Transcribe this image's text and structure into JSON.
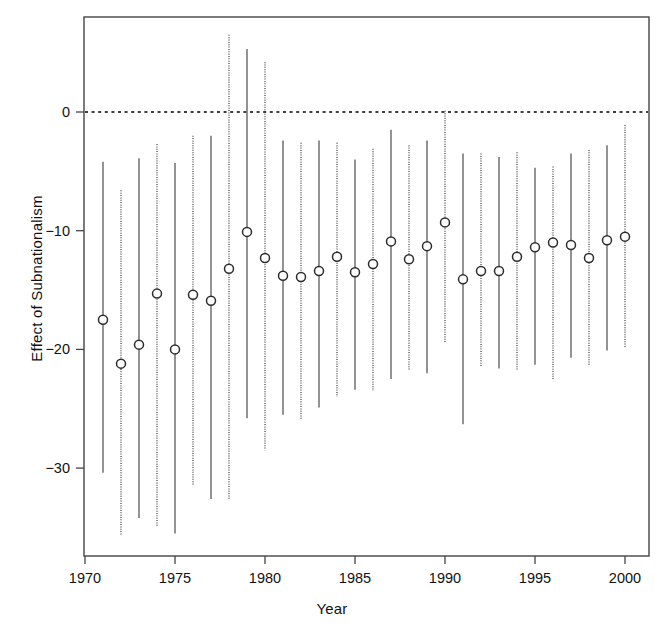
{
  "chart_data": {
    "type": "scatter",
    "title": "",
    "xlabel": "Year",
    "ylabel": "Effect of Subnationalism",
    "xlim": [
      1970.0,
      2000.9
    ],
    "ylim": [
      -37.5,
      8.5
    ],
    "xticks": [
      1970,
      1975,
      1980,
      1985,
      1990,
      1995,
      2000
    ],
    "xtick_labels": [
      "1970",
      "1975",
      "1980",
      "1985",
      "1990",
      "1995",
      "2000"
    ],
    "yticks": [
      0,
      -10,
      -20,
      -30
    ],
    "ytick_labels": [
      "0",
      "-10",
      "-20",
      "-30"
    ],
    "grid": false,
    "legend": null,
    "reference_line": {
      "y": 0,
      "style": "dotted",
      "color": "#000000"
    },
    "marker": {
      "shape": "circle-open",
      "size_px": 9,
      "color": "#2b2b2b"
    },
    "errorbar_styles": [
      "solid",
      "dotted"
    ],
    "x": [
      1971,
      1972,
      1973,
      1974,
      1975,
      1976,
      1977,
      1978,
      1979,
      1980,
      1981,
      1982,
      1983,
      1984,
      1985,
      1986,
      1987,
      1988,
      1989,
      1990,
      1991,
      1992,
      1993,
      1994,
      1995,
      1996,
      1997,
      1998,
      1999,
      2000
    ],
    "values": [
      -17.5,
      -21.2,
      -19.6,
      -15.3,
      -20.0,
      -15.4,
      -15.9,
      -13.2,
      -10.1,
      -12.3,
      -13.8,
      -13.9,
      -13.4,
      -12.2,
      -13.5,
      -12.8,
      -10.9,
      -12.4,
      -11.3,
      -9.3,
      -14.1,
      -13.4,
      -13.4,
      -12.2,
      -11.4,
      -11.0,
      -11.2,
      -12.3,
      -10.8,
      -10.5
    ],
    "ci_lower": [
      -30.4,
      -35.7,
      -34.2,
      -34.9,
      -35.5,
      -31.5,
      -32.6,
      -32.6,
      -25.8,
      -28.5,
      -25.5,
      -25.9,
      -24.9,
      -24.0,
      -23.4,
      -23.5,
      -22.5,
      -21.8,
      -22.0,
      -19.5,
      -26.3,
      -21.4,
      -21.6,
      -21.7,
      -21.3,
      -22.5,
      -20.7,
      -21.4,
      -20.1,
      -19.9
    ],
    "ci_upper": [
      -4.2,
      -6.6,
      -3.9,
      -2.7,
      -4.3,
      -2.0,
      -2.0,
      6.5,
      5.3,
      4.2,
      -2.4,
      -2.6,
      -2.4,
      -2.6,
      -4.0,
      -3.1,
      -1.5,
      -2.8,
      -2.4,
      0.1,
      -3.5,
      -3.5,
      -3.8,
      -3.4,
      -4.7,
      -4.6,
      -3.5,
      -3.2,
      -2.8,
      -1.1
    ],
    "series_name": "Effect of Subnationalism",
    "n_points": 30
  },
  "figure": {
    "xlabel": "Year",
    "ylabel": "Effect of Subnationalism"
  }
}
